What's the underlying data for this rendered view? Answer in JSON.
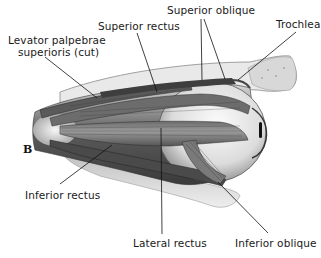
{
  "figure": {
    "panel_letter": "B",
    "labels": {
      "superior_oblique": "Superior oblique",
      "superior_rectus": "Superior rectus",
      "trochlea": "Trochlea",
      "levator_line1": "Levator palpebrae",
      "levator_line2": "superioris (cut)",
      "inferior_rectus": "Inferior rectus",
      "lateral_rectus": "Lateral rectus",
      "inferior_oblique": "Inferior oblique"
    },
    "colors": {
      "background": "#ffffff",
      "text": "#1a1a1a",
      "leader_line": "#111111",
      "muscle_dark": "#4a4a4a",
      "muscle_mid": "#8a8a8a",
      "eyeball": "#e6e6e6"
    }
  }
}
